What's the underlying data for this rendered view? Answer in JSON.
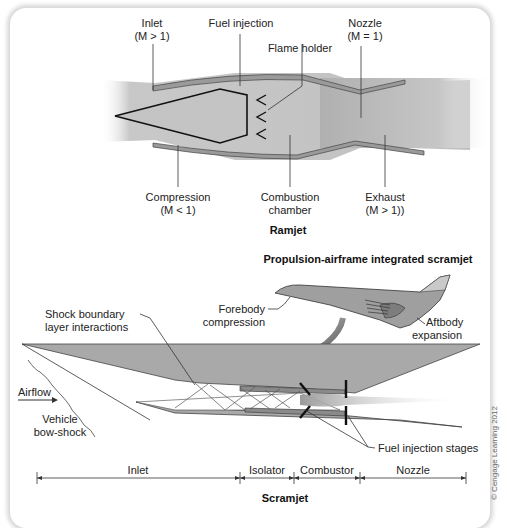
{
  "ramjet": {
    "title": "Ramjet",
    "labels": {
      "inlet": "Inlet",
      "inlet_mach": "(M > 1)",
      "fuel_injection": "Fuel injection",
      "flame_holder": "Flame holder",
      "nozzle": "Nozzle",
      "nozzle_mach": "(M = 1)",
      "compression": "Compression",
      "compression_mach": "(M < 1)",
      "combustion_1": "Combustion",
      "combustion_2": "chamber",
      "exhaust": "Exhaust",
      "exhaust_mach": "(M > 1))"
    }
  },
  "scramjet": {
    "title": "Scramjet",
    "vehicle_title": "Propulsion-airframe integrated scramjet",
    "labels": {
      "forebody_1": "Forebody",
      "forebody_2": "compression",
      "aftbody_1": "Aftbody",
      "aftbody_2": "expansion",
      "shock_1": "Shock boundary",
      "shock_2": "layer interactions",
      "airflow": "Airflow",
      "bowshock_1": "Vehicle",
      "bowshock_2": "bow-shock",
      "fuel_stages": "Fuel injection stages"
    },
    "sections": [
      {
        "label": "Inlet"
      },
      {
        "label": "Isolator"
      },
      {
        "label": "Combustor"
      },
      {
        "label": "Nozzle"
      }
    ]
  },
  "copyright": "© Cengage Learning 2012",
  "colors": {
    "body_gray": "#a9a9a9",
    "flow_gray": "#bdbdbd",
    "line": "#1a1a1a"
  }
}
